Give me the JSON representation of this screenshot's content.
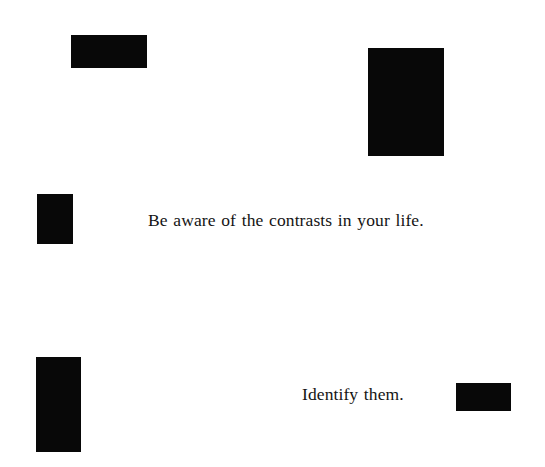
{
  "page": {
    "width": 545,
    "height": 467,
    "background_color": "#ffffff",
    "ink_color": "#080808",
    "text_color": "#141414"
  },
  "captions": [
    {
      "name": "primary-caption",
      "text": "Be aware of the contrasts in your life.",
      "x": 148,
      "y": 212,
      "font_size": 17.5
    },
    {
      "name": "secondary-caption",
      "text": "Identify them.",
      "x": 302,
      "y": 386,
      "font_size": 17.5
    }
  ],
  "shapes": [
    {
      "name": "black-rectangle-top-left",
      "x": 71,
      "y": 35,
      "width": 76,
      "height": 33,
      "color": "#080808"
    },
    {
      "name": "black-rectangle-top-right",
      "x": 368,
      "y": 48,
      "width": 76,
      "height": 108,
      "color": "#080808"
    },
    {
      "name": "black-rectangle-middle-left",
      "x": 37,
      "y": 194,
      "width": 36,
      "height": 50,
      "color": "#080808"
    },
    {
      "name": "black-rectangle-bottom-left",
      "x": 36,
      "y": 357,
      "width": 45,
      "height": 95,
      "color": "#080808"
    },
    {
      "name": "black-rectangle-bottom-right",
      "x": 456,
      "y": 383,
      "width": 55,
      "height": 28,
      "color": "#080808"
    }
  ]
}
